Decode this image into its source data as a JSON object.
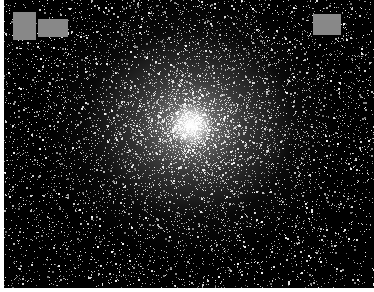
{
  "image": {
    "subject": "globular star cluster",
    "background_color": "#000000",
    "star_color": "#ffffff",
    "core_center": [
      191,
      125
    ],
    "border_color": "#ffffff"
  },
  "redactions": [
    {
      "x": 13,
      "y": 12,
      "w": 23,
      "h": 28,
      "color": "#888888"
    },
    {
      "x": 38,
      "y": 19,
      "w": 30,
      "h": 18,
      "color": "#888888"
    },
    {
      "x": 313,
      "y": 14,
      "w": 28,
      "h": 21,
      "color": "#888888"
    }
  ]
}
